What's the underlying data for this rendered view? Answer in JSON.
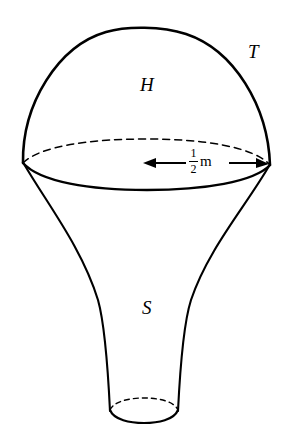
{
  "figure": {
    "background_color": "#ffffff",
    "stroke_color": "#000000",
    "labels": {
      "hemisphere_region": "H",
      "hemisphere_surface": "T",
      "stem_region": "S"
    },
    "dimension": {
      "numerator": "1",
      "denominator": "2",
      "unit": "m",
      "full_text": "1/2 m",
      "description": "radius of the hemisphere base circle"
    }
  }
}
